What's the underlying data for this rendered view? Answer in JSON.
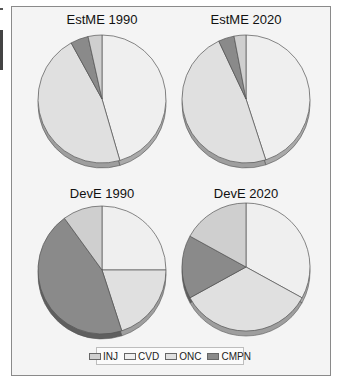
{
  "chart_data": {
    "type": "pie",
    "legend": [
      "INJ",
      "CVD",
      "ONC",
      "CMPN"
    ],
    "legend_position": "bottom",
    "colors": {
      "INJ": "#cfcfcf",
      "CVD": "#efefef",
      "ONC": "#e0e0e0",
      "CMPN": "#8a8a8a"
    },
    "pies": [
      {
        "title": "EstME 1990",
        "slices": {
          "CVD": 45.5,
          "ONC": 46.5,
          "CMPN": 4.5,
          "INJ": 3.5
        }
      },
      {
        "title": "EstME 2020",
        "slices": {
          "CVD": 45,
          "ONC": 48,
          "CMPN": 4,
          "INJ": 3
        }
      },
      {
        "title": "DevE 1990",
        "slices": {
          "CVD": 25,
          "ONC": 20,
          "CMPN": 45,
          "INJ": 10
        }
      },
      {
        "title": "DevE 2020",
        "slices": {
          "CVD": 33,
          "ONC": 34,
          "CMPN": 16,
          "INJ": 17
        }
      }
    ],
    "slice_order_clockwise_from_top": [
      "CVD",
      "ONC",
      "CMPN",
      "INJ"
    ]
  },
  "titles": {
    "p0": "EstME 1990",
    "p1": "EstME 2020",
    "p2": "DevE 1990",
    "p3": "DevE 2020"
  },
  "legend": {
    "inj": "INJ",
    "cvd": "CVD",
    "onc": "ONC",
    "cmpn": "CMPN"
  }
}
